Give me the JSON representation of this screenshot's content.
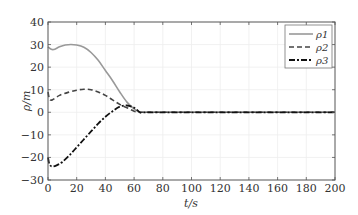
{
  "chart_data": {
    "type": "line",
    "title": "",
    "xlabel": "t/s",
    "ylabel": "ρ/m",
    "xlim": [
      0,
      200
    ],
    "ylim": [
      -30,
      40
    ],
    "xticks": [
      0,
      20,
      40,
      60,
      80,
      100,
      120,
      140,
      160,
      180,
      200
    ],
    "yticks": [
      -30,
      -20,
      -10,
      0,
      10,
      20,
      30,
      40
    ],
    "grid": true,
    "legend_position": "upper right",
    "series": [
      {
        "name": "ρ1",
        "style": "solid",
        "color": "#999999",
        "x": [
          0,
          2,
          4,
          8,
          12,
          16,
          20,
          25,
          30,
          35,
          40,
          45,
          50,
          55,
          60,
          64,
          66,
          80,
          100,
          120,
          140,
          160,
          180,
          200
        ],
        "y": [
          29,
          28,
          27.8,
          29,
          29.8,
          30,
          29.8,
          28.8,
          26.5,
          23,
          18.5,
          14,
          9,
          4.5,
          1.5,
          0,
          0,
          0,
          0,
          0,
          0,
          0,
          0,
          0
        ]
      },
      {
        "name": "ρ2",
        "style": "dashed",
        "color": "#444444",
        "x": [
          0,
          1,
          3,
          8,
          15,
          20,
          25,
          30,
          35,
          40,
          45,
          50,
          55,
          60,
          64,
          66,
          80,
          100,
          120,
          140,
          160,
          180,
          200
        ],
        "y": [
          9,
          6,
          5.5,
          7.5,
          9,
          9.8,
          10.2,
          10,
          9,
          7.5,
          5.5,
          3.5,
          2,
          0.5,
          0,
          0,
          0,
          0,
          0,
          0,
          0,
          0,
          0
        ]
      },
      {
        "name": "ρ3",
        "style": "dashdot",
        "color": "#111111",
        "x": [
          0,
          1,
          3,
          6,
          10,
          15,
          20,
          25,
          30,
          35,
          40,
          45,
          50,
          55,
          60,
          64,
          66,
          80,
          100,
          120,
          140,
          160,
          180,
          200
        ],
        "y": [
          -20,
          -23,
          -24,
          -23.5,
          -22,
          -19,
          -15.5,
          -12,
          -8.5,
          -5,
          -2,
          0.5,
          2.5,
          3,
          2,
          0,
          0,
          0,
          0,
          0,
          0,
          0,
          0,
          0
        ]
      }
    ]
  },
  "legend": {
    "items": [
      {
        "label": "ρ1"
      },
      {
        "label": "ρ2"
      },
      {
        "label": "ρ3"
      }
    ]
  },
  "axes": {
    "xlabel": "t/s",
    "ylabel": "ρ/m"
  }
}
